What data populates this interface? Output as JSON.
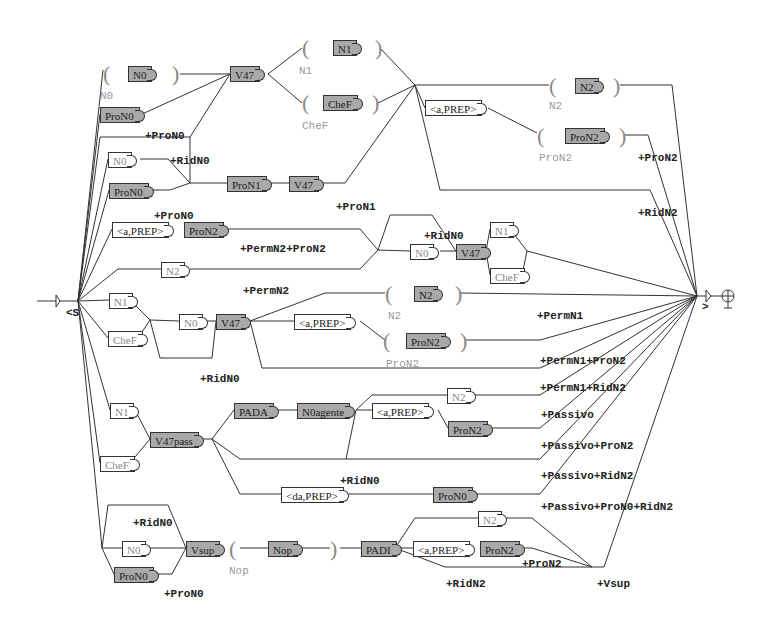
{
  "diagram": {
    "type": "finite-state transducer graph (Unitex-style)",
    "start_label": "<S",
    "end_label": ">",
    "boxes": [
      {
        "id": "b1",
        "text": "N0",
        "x": 128,
        "y": 66,
        "style": "grey"
      },
      {
        "id": "b2",
        "text": "V47",
        "x": 230,
        "y": 66,
        "style": "grey"
      },
      {
        "id": "b3",
        "text": "N1",
        "x": 333,
        "y": 40,
        "style": "grey"
      },
      {
        "id": "b4",
        "text": "CheF",
        "x": 323,
        "y": 95,
        "style": "grey"
      },
      {
        "id": "b5",
        "text": "ProN0",
        "x": 100,
        "y": 107,
        "style": "grey"
      },
      {
        "id": "b6",
        "text": "N0",
        "x": 108,
        "y": 152,
        "style": "white"
      },
      {
        "id": "b7",
        "text": "ProN0",
        "x": 109,
        "y": 183,
        "style": "grey"
      },
      {
        "id": "b8",
        "text": "ProN1",
        "x": 227,
        "y": 176,
        "style": "grey"
      },
      {
        "id": "b9",
        "text": "V47",
        "x": 289,
        "y": 176,
        "style": "grey"
      },
      {
        "id": "b10",
        "text": "<a,PREP>",
        "x": 425,
        "y": 100,
        "style": "prep"
      },
      {
        "id": "b11",
        "text": "N2",
        "x": 575,
        "y": 78,
        "style": "grey"
      },
      {
        "id": "b12",
        "text": "ProN2",
        "x": 565,
        "y": 128,
        "style": "grey"
      },
      {
        "id": "b13",
        "text": "<a,PREP>",
        "x": 112,
        "y": 222,
        "style": "prep"
      },
      {
        "id": "b14",
        "text": "ProN2",
        "x": 184,
        "y": 222,
        "style": "grey"
      },
      {
        "id": "b15",
        "text": "N2",
        "x": 161,
        "y": 262,
        "style": "white"
      },
      {
        "id": "b16",
        "text": "N0",
        "x": 410,
        "y": 244,
        "style": "white"
      },
      {
        "id": "b17",
        "text": "V47",
        "x": 456,
        "y": 244,
        "style": "grey"
      },
      {
        "id": "b18",
        "text": "N1",
        "x": 490,
        "y": 222,
        "style": "white"
      },
      {
        "id": "b19",
        "text": "CheF",
        "x": 490,
        "y": 268,
        "style": "white"
      },
      {
        "id": "b20",
        "text": "N1",
        "x": 109,
        "y": 293,
        "style": "white"
      },
      {
        "id": "b21",
        "text": "CheF",
        "x": 108,
        "y": 331,
        "style": "white"
      },
      {
        "id": "b22",
        "text": "N0",
        "x": 179,
        "y": 314,
        "style": "white"
      },
      {
        "id": "b23",
        "text": "V47",
        "x": 216,
        "y": 314,
        "style": "grey"
      },
      {
        "id": "b24",
        "text": "<a,PREP>",
        "x": 294,
        "y": 314,
        "style": "prep"
      },
      {
        "id": "b25",
        "text": "N2",
        "x": 414,
        "y": 286,
        "style": "grey"
      },
      {
        "id": "b26",
        "text": "ProN2",
        "x": 406,
        "y": 333,
        "style": "grey"
      },
      {
        "id": "b27",
        "text": "N1",
        "x": 110,
        "y": 403,
        "style": "white"
      },
      {
        "id": "b28",
        "text": "V47pass",
        "x": 150,
        "y": 432,
        "style": "grey"
      },
      {
        "id": "b29",
        "text": "CheF",
        "x": 100,
        "y": 456,
        "style": "white"
      },
      {
        "id": "b30",
        "text": "PADA",
        "x": 234,
        "y": 403,
        "style": "grey"
      },
      {
        "id": "b31",
        "text": "N0agente",
        "x": 297,
        "y": 403,
        "style": "grey"
      },
      {
        "id": "b32",
        "text": "<a,PREP>",
        "x": 372,
        "y": 403,
        "style": "prep"
      },
      {
        "id": "b33",
        "text": "N2",
        "x": 447,
        "y": 388,
        "style": "white"
      },
      {
        "id": "b34",
        "text": "ProN2",
        "x": 448,
        "y": 421,
        "style": "grey"
      },
      {
        "id": "b35",
        "text": "<da,PREP>",
        "x": 281,
        "y": 487,
        "style": "prep"
      },
      {
        "id": "b36",
        "text": "ProN0",
        "x": 433,
        "y": 487,
        "style": "grey"
      },
      {
        "id": "b37",
        "text": "N0",
        "x": 122,
        "y": 541,
        "style": "white"
      },
      {
        "id": "b38",
        "text": "Vsup",
        "x": 186,
        "y": 541,
        "style": "grey"
      },
      {
        "id": "b39",
        "text": "ProN0",
        "x": 114,
        "y": 567,
        "style": "grey"
      },
      {
        "id": "b40",
        "text": "Nop",
        "x": 268,
        "y": 541,
        "style": "grey"
      },
      {
        "id": "b41",
        "text": "PADI",
        "x": 361,
        "y": 541,
        "style": "grey"
      },
      {
        "id": "b42",
        "text": "<a,PREP>",
        "x": 413,
        "y": 541,
        "style": "prep"
      },
      {
        "id": "b43",
        "text": "ProN2",
        "x": 480,
        "y": 541,
        "style": "grey"
      },
      {
        "id": "b44",
        "text": "N2",
        "x": 478,
        "y": 511,
        "style": "white"
      }
    ],
    "output_labels": [
      {
        "text": "+ProN0",
        "x": 145,
        "y": 130
      },
      {
        "text": "+RidN0",
        "x": 170,
        "y": 155
      },
      {
        "text": "+ProN0",
        "x": 154,
        "y": 210
      },
      {
        "text": "+ProN1",
        "x": 336,
        "y": 201
      },
      {
        "text": "+ProN2",
        "x": 638,
        "y": 152
      },
      {
        "text": "+RidN2",
        "x": 638,
        "y": 207
      },
      {
        "text": "+RidN0",
        "x": 424,
        "y": 230
      },
      {
        "text": "+PermN2+ProN2",
        "x": 240,
        "y": 243
      },
      {
        "text": "+PermN2",
        "x": 243,
        "y": 285
      },
      {
        "text": "+PermN1",
        "x": 537,
        "y": 310
      },
      {
        "text": "+RidN0",
        "x": 200,
        "y": 373
      },
      {
        "text": "+PermN1+ProN2",
        "x": 540,
        "y": 355
      },
      {
        "text": "+PermN1+RidN2",
        "x": 540,
        "y": 382
      },
      {
        "text": "+Passivo",
        "x": 541,
        "y": 409
      },
      {
        "text": "+Passivo+ProN2",
        "x": 541,
        "y": 440
      },
      {
        "text": "+Passivo+RidN2",
        "x": 541,
        "y": 470
      },
      {
        "text": "+RidN0",
        "x": 340,
        "y": 475
      },
      {
        "text": "+Passivo+ProN0+RidN2",
        "x": 541,
        "y": 501
      },
      {
        "text": "+RidN0",
        "x": 133,
        "y": 517
      },
      {
        "text": "+ProN0",
        "x": 164,
        "y": 588
      },
      {
        "text": "+ProN2",
        "x": 522,
        "y": 558
      },
      {
        "text": "+RidN2",
        "x": 446,
        "y": 578
      },
      {
        "text": "+Vsup",
        "x": 597,
        "y": 578
      }
    ],
    "comment_labels": [
      {
        "text": "N0",
        "x": 100,
        "y": 90
      },
      {
        "text": "N1",
        "x": 299,
        "y": 65
      },
      {
        "text": "CheF",
        "x": 302,
        "y": 120
      },
      {
        "text": "N2",
        "x": 549,
        "y": 100
      },
      {
        "text": "ProN2",
        "x": 539,
        "y": 152
      },
      {
        "text": "N2",
        "x": 388,
        "y": 310
      },
      {
        "text": "ProN2",
        "x": 386,
        "y": 358
      },
      {
        "text": "Nop",
        "x": 229,
        "y": 565
      }
    ],
    "parens": [
      {
        "t": "(",
        "x": 103,
        "y": 63
      },
      {
        "t": ")",
        "x": 172,
        "y": 63
      },
      {
        "t": "(",
        "x": 302,
        "y": 37
      },
      {
        "t": ")",
        "x": 375,
        "y": 37
      },
      {
        "t": "(",
        "x": 302,
        "y": 92
      },
      {
        "t": ")",
        "x": 372,
        "y": 92
      },
      {
        "t": "(",
        "x": 549,
        "y": 75
      },
      {
        "t": ")",
        "x": 613,
        "y": 75
      },
      {
        "t": "(",
        "x": 537,
        "y": 125
      },
      {
        "t": ")",
        "x": 619,
        "y": 125
      },
      {
        "t": "(",
        "x": 385,
        "y": 283
      },
      {
        "t": ")",
        "x": 455,
        "y": 283
      },
      {
        "t": "(",
        "x": 383,
        "y": 330
      },
      {
        "t": ")",
        "x": 460,
        "y": 330
      },
      {
        "t": "(",
        "x": 229,
        "y": 538
      },
      {
        "t": ")",
        "x": 330,
        "y": 538
      }
    ]
  }
}
